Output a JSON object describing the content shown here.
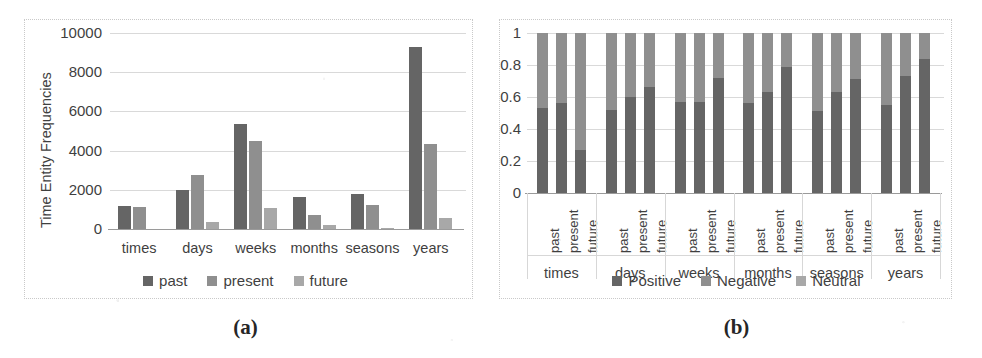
{
  "figure": {
    "panels": [
      {
        "caption": "(a)",
        "ylabel": "Time Entity Frequencies",
        "ytick_labels": [
          "0",
          "2000",
          "4000",
          "6000",
          "8000",
          "10000"
        ],
        "categories": [
          "times",
          "days",
          "weeks",
          "months",
          "seasons",
          "years"
        ],
        "legend": [
          "past",
          "present",
          "future"
        ]
      },
      {
        "caption": "(b)",
        "ylabel": "",
        "ytick_labels": [
          "0",
          "0.2",
          "0.4",
          "0.6",
          "0.8",
          "1"
        ],
        "categories": [
          "times",
          "days",
          "weeks",
          "months",
          "seasons",
          "years"
        ],
        "subcategories": [
          "past",
          "present",
          "future"
        ],
        "legend": [
          "Positive",
          "Negative",
          "Neutral"
        ]
      }
    ]
  },
  "colors": {
    "positive_dark": "#656565",
    "negative_mid": "#8f8f8f",
    "neutral_light": "#a8a8a8",
    "past": "#656565",
    "present": "#8f8f8f",
    "future": "#a8a8a8",
    "gridline": "#d9d9d9",
    "axis": "#9a9a9a",
    "frame": "#c9c9c9",
    "text": "#3f3f3f",
    "background": "#ffffff"
  },
  "chart_data": [
    {
      "type": "bar",
      "title": "(a)",
      "xlabel": "",
      "ylabel": "Time Entity Frequencies",
      "ylim": [
        0,
        10000
      ],
      "yticks": [
        0,
        2000,
        4000,
        6000,
        8000,
        10000
      ],
      "grid": true,
      "legend_position": "bottom",
      "categories": [
        "times",
        "days",
        "weeks",
        "months",
        "seasons",
        "years"
      ],
      "series": [
        {
          "name": "past",
          "values": [
            1150,
            2000,
            5350,
            1650,
            1800,
            9300
          ]
        },
        {
          "name": "present",
          "values": [
            1100,
            2750,
            4500,
            700,
            1200,
            4350
          ]
        },
        {
          "name": "future",
          "values": [
            0,
            350,
            1050,
            200,
            30,
            550
          ]
        }
      ]
    },
    {
      "type": "bar",
      "stacked": true,
      "normalized": true,
      "title": "(b)",
      "xlabel": "",
      "ylabel": "",
      "ylim": [
        0,
        1
      ],
      "yticks": [
        0,
        0.2,
        0.4,
        0.6,
        0.8,
        1
      ],
      "grid": true,
      "legend_position": "bottom",
      "categories": [
        "times",
        "days",
        "weeks",
        "months",
        "seasons",
        "years"
      ],
      "subcategories": [
        "past",
        "present",
        "future"
      ],
      "x": [
        "times past",
        "times present",
        "times future",
        "days past",
        "days present",
        "days future",
        "weeks past",
        "weeks present",
        "weeks future",
        "months past",
        "months present",
        "months future",
        "seasons past",
        "seasons present",
        "seasons future",
        "years past",
        "years present",
        "years future"
      ],
      "series": [
        {
          "name": "Positive",
          "values": [
            0.53,
            0.56,
            0.27,
            0.52,
            0.6,
            0.66,
            0.57,
            0.57,
            0.72,
            0.56,
            0.63,
            0.79,
            0.51,
            0.63,
            0.71,
            0.55,
            0.73,
            0.84
          ]
        },
        {
          "name": "Negative",
          "values": [
            0.47,
            0.44,
            0.73,
            0.48,
            0.4,
            0.34,
            0.43,
            0.43,
            0.28,
            0.44,
            0.37,
            0.21,
            0.49,
            0.37,
            0.29,
            0.45,
            0.27,
            0.16
          ]
        },
        {
          "name": "Neutral",
          "values": [
            0.0,
            0.0,
            0.0,
            0.0,
            0.0,
            0.0,
            0.0,
            0.0,
            0.0,
            0.0,
            0.0,
            0.0,
            0.0,
            0.0,
            0.0,
            0.0,
            0.0,
            0.0
          ]
        }
      ]
    }
  ]
}
